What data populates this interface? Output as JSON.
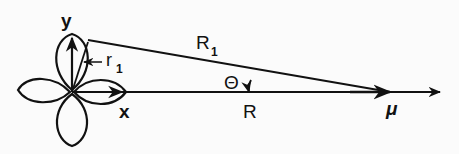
{
  "diagram": {
    "labels": {
      "y_axis": "y",
      "x_axis": "x",
      "r1": "r",
      "r1_sub": "1",
      "R1": "R",
      "R1_sub": "1",
      "theta": "Θ",
      "R": "R",
      "mu": "μ"
    },
    "colors": {
      "stroke": "#111111",
      "background": "#fbfbfb"
    }
  }
}
